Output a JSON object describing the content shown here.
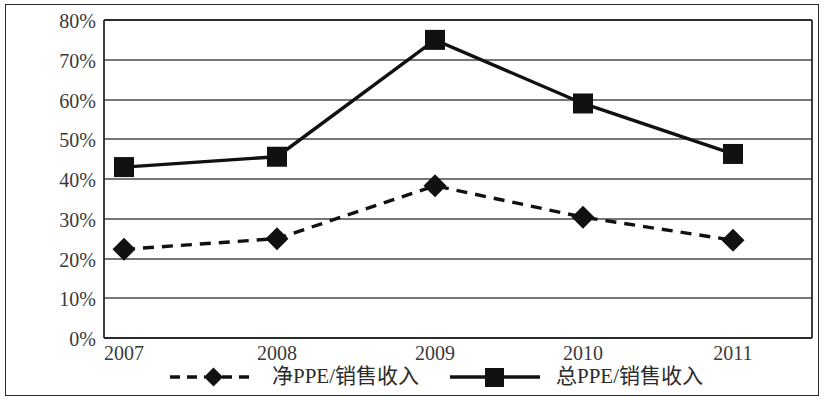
{
  "chart_data": {
    "type": "line",
    "title": "",
    "subtitle": "",
    "xlabel": "",
    "ylabel": "",
    "categories": [
      "2007",
      "2008",
      "2009",
      "2010",
      "2011"
    ],
    "ylim": [
      0,
      80
    ],
    "ytick_labels": [
      "0%",
      "10%",
      "20%",
      "30%",
      "40%",
      "50%",
      "60%",
      "70%",
      "80%"
    ],
    "ytick_values": [
      0,
      10,
      20,
      30,
      40,
      50,
      60,
      70,
      80
    ],
    "grid": "horizontal",
    "legend_position": "bottom",
    "series": [
      {
        "name": "净PPE/销售收入",
        "marker": "diamond",
        "line_style": "dashed",
        "color": "#111111",
        "values": [
          22.3,
          25.0,
          38.3,
          30.4,
          24.6
        ]
      },
      {
        "name": "总PPE/销售收入",
        "marker": "square",
        "line_style": "solid",
        "color": "#111111",
        "values": [
          43.0,
          45.6,
          75.0,
          59.0,
          46.3
        ]
      }
    ]
  },
  "legend": {
    "entries": [
      {
        "label": "净PPE/销售收入",
        "marker": "diamond-marker",
        "style": "dashed"
      },
      {
        "label": "总PPE/销售收入",
        "marker": "square-marker",
        "style": "solid"
      }
    ]
  },
  "axes": {
    "y": {
      "ticks": [
        "80%",
        "70%",
        "60%",
        "50%",
        "40%",
        "30%",
        "20%",
        "10%",
        "0%"
      ]
    },
    "x": {
      "ticks": [
        "2007",
        "2008",
        "2009",
        "2010",
        "2011"
      ]
    }
  }
}
